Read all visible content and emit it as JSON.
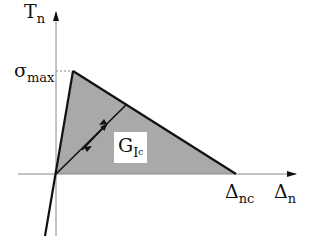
{
  "diagram": {
    "type": "bilinear-traction-separation-law",
    "y_axis": {
      "symbol": "T",
      "subscript": "n"
    },
    "x_axis": {
      "symbol": "Δ",
      "subscript": "n"
    },
    "peak_label": {
      "symbol": "σ",
      "subscript": "max"
    },
    "end_label": {
      "symbol": "Δ",
      "subscript": "nc"
    },
    "area_label": {
      "symbol": "G",
      "subscript": "I",
      "subsubscript": "c"
    },
    "colors": {
      "fill": "#a9a9a9",
      "line": "#111111",
      "axis": "#888888",
      "background": "#ffffff"
    }
  }
}
